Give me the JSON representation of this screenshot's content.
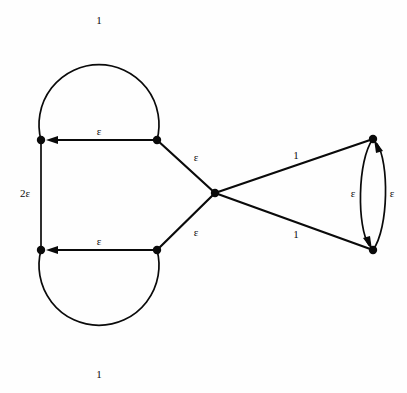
{
  "figure": {
    "type": "directed-weighted-graph",
    "title": "",
    "background_color": "#fefefe",
    "stroke_color": "#0a0a0a",
    "width": 407,
    "height": 393
  },
  "vertices": [
    {
      "id": "v-top-left",
      "name": "vertex-top-left",
      "x": 41,
      "y": 140
    },
    {
      "id": "v-top-mid",
      "name": "vertex-top-mid",
      "x": 157,
      "y": 140
    },
    {
      "id": "v-bottom-left",
      "name": "vertex-bottom-left",
      "x": 41,
      "y": 250
    },
    {
      "id": "v-bottom-mid",
      "name": "vertex-bottom-mid",
      "x": 157,
      "y": 250
    },
    {
      "id": "v-center",
      "name": "vertex-center",
      "x": 215,
      "y": 193
    },
    {
      "id": "v-right-top",
      "name": "vertex-right-top",
      "x": 373,
      "y": 139
    },
    {
      "id": "v-right-bottom",
      "name": "vertex-right-bottom",
      "x": 373,
      "y": 250
    }
  ],
  "edges": [
    {
      "id": "e-top-loop",
      "name": "edge-top-circle",
      "from": "v-top-mid",
      "to": "v-top-left",
      "weight": "1",
      "label_x": 99,
      "label_y": 20,
      "directed": false
    },
    {
      "id": "e-top-horizontal",
      "name": "edge-top-horizontal",
      "from": "v-top-mid",
      "to": "v-top-left",
      "weight": "ε",
      "label_x": 99,
      "label_y": 131,
      "directed": true
    },
    {
      "id": "e-left-vertical",
      "name": "edge-left-vertical",
      "from": "v-top-left",
      "to": "v-bottom-left",
      "weight": "2ε",
      "label_x": 25,
      "label_y": 193,
      "directed": false
    },
    {
      "id": "e-bottom-loop",
      "name": "edge-bottom-circle",
      "from": "v-bottom-mid",
      "to": "v-bottom-left",
      "weight": "1",
      "label_x": 99,
      "label_y": 374,
      "directed": false
    },
    {
      "id": "e-bottom-horizontal",
      "name": "edge-bottom-horizontal",
      "from": "v-bottom-mid",
      "to": "v-bottom-left",
      "weight": "ε",
      "label_x": 99,
      "label_y": 241,
      "directed": true
    },
    {
      "id": "e-upper-diagonal",
      "name": "edge-upper-diagonal",
      "from": "v-center",
      "to": "v-top-mid",
      "weight": "ε",
      "label_x": 196,
      "label_y": 157,
      "directed": false
    },
    {
      "id": "e-lower-diagonal",
      "name": "edge-lower-diagonal",
      "from": "v-center",
      "to": "v-bottom-mid",
      "weight": "ε",
      "label_x": 196,
      "label_y": 232,
      "directed": false
    },
    {
      "id": "e-upper-right",
      "name": "edge-upper-right",
      "from": "v-center",
      "to": "v-right-top",
      "weight": "1",
      "label_x": 296,
      "label_y": 155,
      "directed": false
    },
    {
      "id": "e-lower-right",
      "name": "edge-lower-right",
      "from": "v-center",
      "to": "v-right-bottom",
      "weight": "1",
      "label_x": 296,
      "label_y": 234,
      "directed": false
    },
    {
      "id": "e-arc-down",
      "name": "edge-right-arc-down",
      "from": "v-right-top",
      "to": "v-right-bottom",
      "weight": "ε",
      "label_x": 353,
      "label_y": 193,
      "directed": true
    },
    {
      "id": "e-arc-up",
      "name": "edge-right-arc-up",
      "from": "v-right-bottom",
      "to": "v-right-top",
      "weight": "ε",
      "label_x": 392,
      "label_y": 193,
      "directed": true
    }
  ]
}
